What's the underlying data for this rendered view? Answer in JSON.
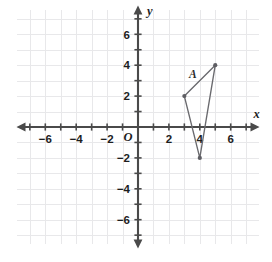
{
  "chart_data": {
    "type": "scatter",
    "title": "",
    "xlabel": "x",
    "ylabel": "y",
    "origin_label": "O",
    "grid": true,
    "grid_step": 1,
    "xlim": [
      -7.8,
      7.8
    ],
    "ylim": [
      -7.8,
      7.8
    ],
    "x_ticks": [
      -7,
      -6,
      -5,
      -4,
      -3,
      -2,
      -1,
      1,
      2,
      3,
      4,
      5,
      6,
      7
    ],
    "y_ticks": [
      -7,
      -6,
      -5,
      -4,
      -3,
      -2,
      -1,
      1,
      2,
      3,
      4,
      5,
      6,
      7
    ],
    "x_tick_labels": [
      {
        "value": -6,
        "text": "−6"
      },
      {
        "value": -4,
        "text": "−4"
      },
      {
        "value": -2,
        "text": "−2"
      },
      {
        "value": 2,
        "text": "2"
      },
      {
        "value": 4,
        "text": "4"
      },
      {
        "value": 6,
        "text": "6"
      }
    ],
    "y_tick_labels": [
      {
        "value": 6,
        "text": "6"
      },
      {
        "value": 4,
        "text": "4"
      },
      {
        "value": 2,
        "text": "2"
      },
      {
        "value": -2,
        "text": "−2"
      },
      {
        "value": -4,
        "text": "−4"
      },
      {
        "value": -6,
        "text": "−6"
      }
    ],
    "grid_extent": {
      "x_min": -7.8,
      "x_max": 7.8,
      "y_min": -7.6,
      "y_max": 7.6
    },
    "series": [
      {
        "name": "triangle",
        "closed": true,
        "label": "A",
        "label_point": {
          "x": 3.55,
          "y": 3.15
        },
        "points": [
          {
            "x": 3,
            "y": 2
          },
          {
            "x": 5,
            "y": 4
          },
          {
            "x": 4,
            "y": -2
          }
        ]
      }
    ],
    "colors": {
      "grid": "#e8e8ea",
      "axis": "#4a4a4a",
      "shape_stroke": "#6a6a6e",
      "vertex_fill": "#5e5e63",
      "label_text": "#1d1d1d",
      "background": "#ffffff"
    }
  }
}
